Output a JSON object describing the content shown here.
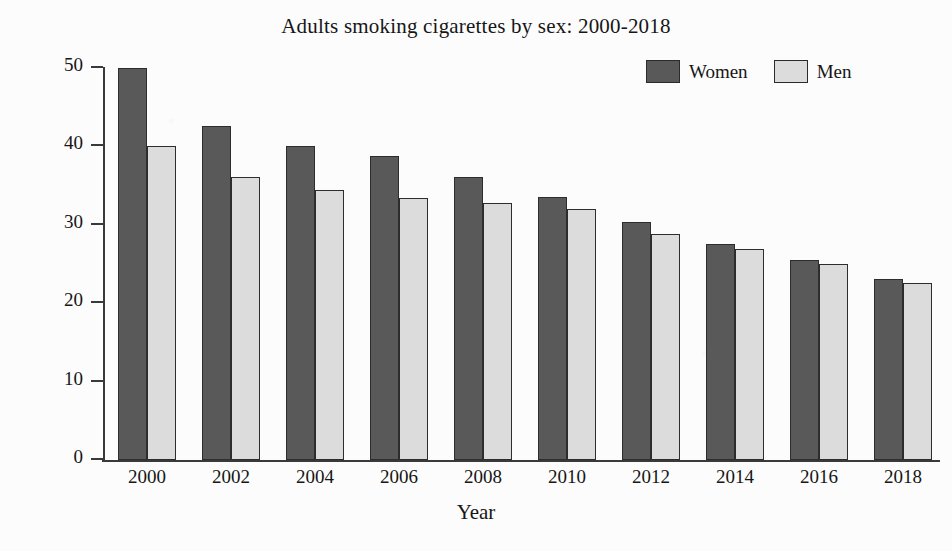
{
  "chart_data": {
    "type": "bar",
    "title": "Adults smoking cigarettes by sex: 2000-2018",
    "xlabel": "Year",
    "ylabel": "Number of Adults who Smoke (thousands)",
    "categories": [
      "2000",
      "2002",
      "2004",
      "2006",
      "2008",
      "2010",
      "2012",
      "2014",
      "2016",
      "2018"
    ],
    "series": [
      {
        "name": "Women",
        "color": "#595959",
        "values": [
          50.0,
          42.6,
          40.1,
          38.8,
          36.1,
          33.6,
          30.3,
          27.5,
          25.5,
          23.1
        ]
      },
      {
        "name": "Men",
        "color": "#dcdcdc",
        "values": [
          40.0,
          36.1,
          34.4,
          33.4,
          32.8,
          32.0,
          28.8,
          26.9,
          25.0,
          22.6
        ]
      }
    ],
    "ylim": [
      0,
      50
    ],
    "yticks": [
      0,
      10,
      20,
      30,
      40,
      50
    ],
    "ytick_labels": [
      "0",
      "10",
      "20",
      "30",
      "40",
      "50"
    ],
    "grid": false,
    "legend_position": "top-right"
  },
  "legend": {
    "entries": [
      {
        "label": "Women",
        "color": "#595959"
      },
      {
        "label": "Men",
        "color": "#dcdcdc"
      }
    ]
  }
}
